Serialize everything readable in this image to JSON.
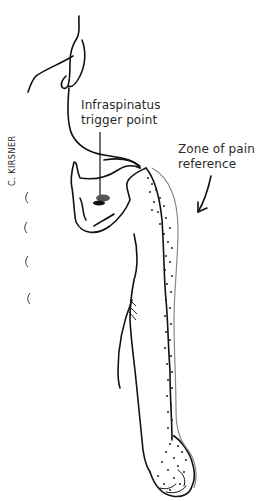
{
  "figure": {
    "labels": {
      "trigger_point_line1": "Infraspinatus",
      "trigger_point_line2": "trigger point",
      "zone_line1": "Zone of pain",
      "zone_line2": "reference"
    },
    "signature": "C. KIRSNER",
    "colors": {
      "ink": "#111111",
      "trigger_point": "#555555",
      "zone_outline": "#888888"
    }
  }
}
